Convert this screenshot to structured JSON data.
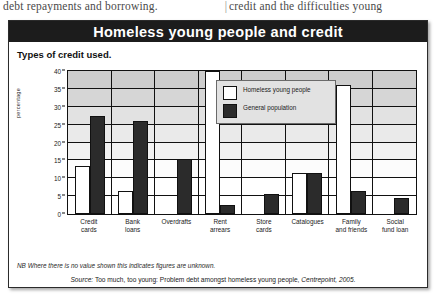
{
  "page_text": {
    "left_column": "debt repayments and borrowing.",
    "divider": "|",
    "right_column": "credit and the difficulties young"
  },
  "panel": {
    "title": "Homeless young people and credit",
    "subtitle": "Types of credit used.",
    "note": "NB Where there is no value shown this indicates figures are unknown.",
    "source_prefix": "Source:",
    "source_text": "Too much, too young: Problem debt amongst homeless young people,",
    "source_publisher": "Centrepoint, 2005."
  },
  "legend": {
    "items": [
      {
        "label": "Homeless young people",
        "swatch": "white",
        "color": "#ffffff"
      },
      {
        "label": "General population",
        "swatch": "dark",
        "color": "#2b2b2b"
      }
    ]
  },
  "colors": {
    "title_bar": "#1c1c1c",
    "series_homeless": "#ffffff",
    "series_general": "#2b2b2b",
    "grid": "#111111",
    "legend_bg": "#e2e2e2"
  },
  "chart_data": {
    "type": "bar",
    "title": "Types of credit used.",
    "xlabel": "",
    "ylabel": "percentage",
    "ylim": [
      0,
      40
    ],
    "yticks": [
      0,
      5,
      10,
      15,
      20,
      25,
      30,
      35,
      40
    ],
    "grid": true,
    "legend_position": "inside-top-center",
    "categories": [
      "Credit cards",
      "Bank loans",
      "Overdrafts",
      "Rent arrears",
      "Store cards",
      "Catalogues",
      "Family and friends",
      "Social fund loan"
    ],
    "category_lines": [
      [
        "Credit",
        "cards"
      ],
      [
        "Bank",
        "loans"
      ],
      [
        "Overdrafts",
        ""
      ],
      [
        "Rent",
        "arrears"
      ],
      [
        "Store",
        "cards"
      ],
      [
        "Catalogues",
        ""
      ],
      [
        "Family",
        "and friends"
      ],
      [
        "Social",
        "fund loan"
      ]
    ],
    "series": [
      {
        "name": "Homeless young people",
        "color": "#ffffff",
        "values": [
          13.5,
          6.3,
          null,
          40,
          null,
          11.5,
          36.2,
          null
        ]
      },
      {
        "name": "General population",
        "color": "#2b2b2b",
        "values": [
          27.5,
          26,
          15.5,
          2.5,
          5.5,
          11.5,
          6.5,
          4.5
        ]
      }
    ],
    "note": "NB Where there is no value shown this indicates figures are unknown."
  }
}
